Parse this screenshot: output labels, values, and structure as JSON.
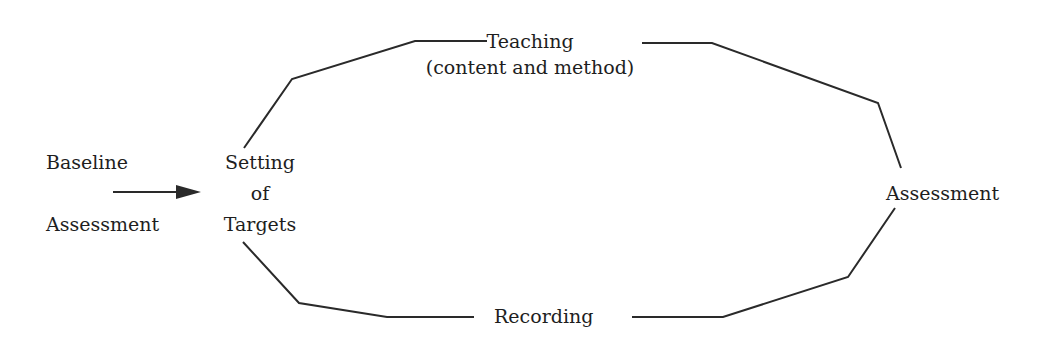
{
  "diagram": {
    "type": "cycle-flow",
    "nodes": {
      "baseline": {
        "line1": "Baseline",
        "line2": "Assessment"
      },
      "setting": {
        "line1": "Setting",
        "line2": "of",
        "line3": "Targets"
      },
      "teaching": {
        "line1": "Teaching",
        "line2": "(content and method)"
      },
      "assessment": {
        "label": "Assessment"
      },
      "recording": {
        "label": "Recording"
      }
    },
    "edges": [
      {
        "from": "Baseline Assessment",
        "to": "Setting of Targets",
        "style": "arrow"
      },
      {
        "from": "Setting of Targets",
        "to": "Teaching (content and method)",
        "style": "line"
      },
      {
        "from": "Teaching (content and method)",
        "to": "Assessment",
        "style": "line"
      },
      {
        "from": "Assessment",
        "to": "Recording",
        "style": "line"
      },
      {
        "from": "Recording",
        "to": "Setting of Targets",
        "style": "line"
      }
    ],
    "colors": {
      "line": "#2a2a2a",
      "text": "#1e1e1e",
      "background": "#ffffff"
    }
  }
}
